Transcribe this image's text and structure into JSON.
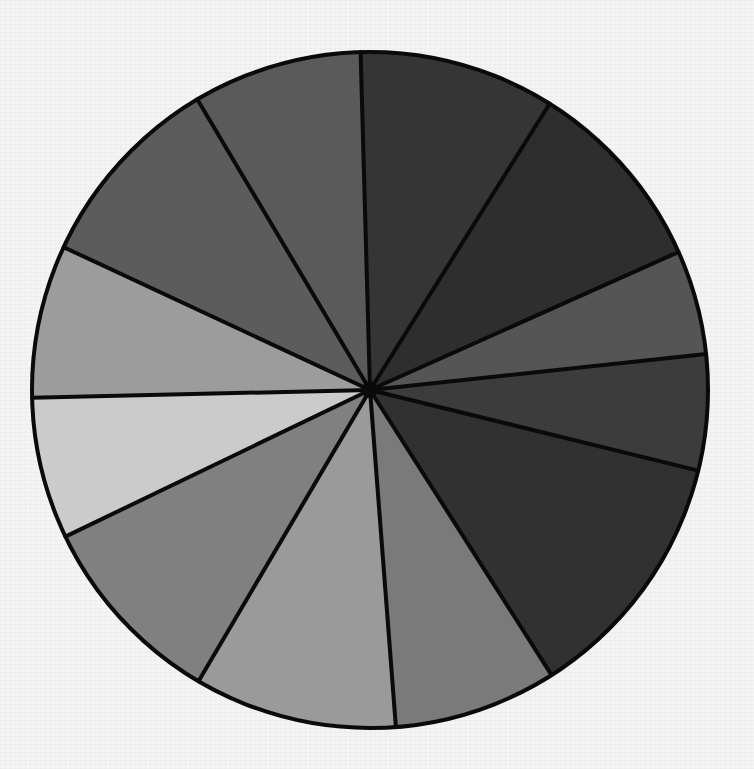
{
  "chart_data": {
    "type": "pie",
    "title": "",
    "style": "hand-drawn grayscale",
    "center": [
      370,
      390
    ],
    "radius": 338,
    "start_angle_deg": 358.4,
    "legend": "none",
    "labels_visible": false,
    "categories": [
      "Slice 1",
      "Slice 2",
      "Slice 3",
      "Slice 4",
      "Slice 5",
      "Slice 6",
      "Slice 7",
      "Slice 8",
      "Slice 9",
      "Slice 10",
      "Slice 11",
      "Slice 12"
    ],
    "values": [
      33.7,
      33.8,
      18.0,
      19.9,
      43.7,
      28.1,
      34.9,
      33.8,
      24.4,
      26.3,
      34.3,
      29.1
    ],
    "values_unit": "degrees (of 360)",
    "colors": [
      "#353535",
      "#2e2e2e",
      "#555555",
      "#3c3c3c",
      "#313131",
      "#7a7a7a",
      "#9a9a9a",
      "#808080",
      "#cbcbcb",
      "#9c9c9c",
      "#5c5c5c",
      "#5a5a5a"
    ]
  },
  "page": {
    "background": "#f4f4f4",
    "outline_color": "#0a0a0a"
  }
}
